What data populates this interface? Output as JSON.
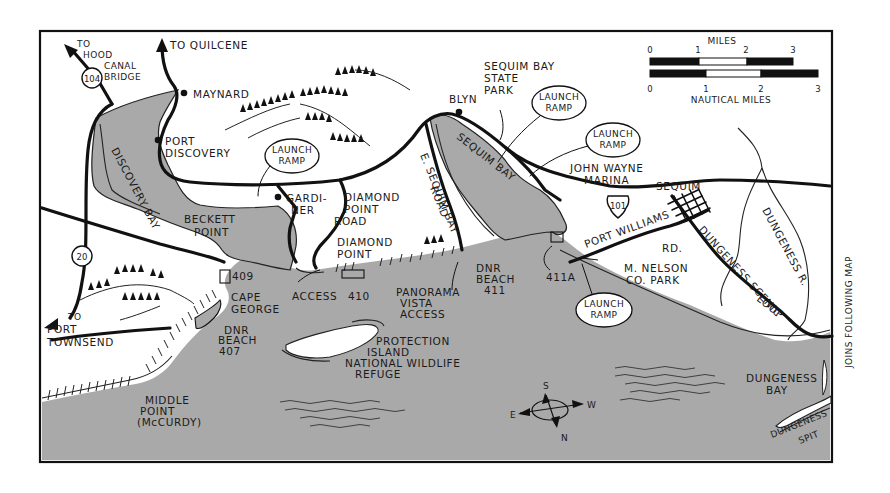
{
  "map": {
    "colors": {
      "water": "#a9a9a9",
      "land": "#ffffff",
      "ink": "#111111"
    },
    "side_note": "JOINS FOLLOWING MAP",
    "routes": {
      "hood_canal": {
        "to": "TO",
        "line1": "HOOD",
        "line2": "CANAL",
        "line3": "BRIDGE",
        "shield": "104"
      },
      "quilcene": {
        "label": "TO QUILCENE"
      },
      "port_townsend": {
        "to": "TO",
        "line1": "PORT",
        "line2": "TOWNSEND",
        "shield": "20"
      },
      "us101": {
        "shield": "101"
      }
    },
    "places": {
      "maynard": "MAYNARD",
      "port_discovery": {
        "line1": "PORT",
        "line2": "DISCOVERY"
      },
      "discovery_bay": "DISCOVERY BAY",
      "beckett_point": {
        "line1": "BECKETT",
        "line2": "POINT"
      },
      "gardiner": {
        "line1": "GARDI-",
        "line2": "NER"
      },
      "diamond_point_road": {
        "line1": "DIAMOND",
        "line2": "POINT",
        "line3": "ROAD"
      },
      "diamond_point": {
        "line1": "DIAMOND",
        "line2": "POINT"
      },
      "blyn": "BLYN",
      "sequim_bay_state_park": {
        "line1": "SEQUIM BAY",
        "line2": "STATE",
        "line3": "PARK"
      },
      "e_sequim_bay_road": {
        "line1": "E. SEQUIM BAY",
        "line2": "ROAD"
      },
      "sequim_bay": "SEQUIM BAY",
      "john_wayne_marina": {
        "line1": "JOHN WAYNE",
        "line2": "MARINA"
      },
      "sequim": "SEQUIM",
      "port_williams_rd": {
        "line1": "PORT WILLIAMS",
        "line2": "RD."
      },
      "m_nelson_park": {
        "line1": "M. NELSON",
        "line2": "CO. PARK"
      },
      "dungeness_scenic_loop": {
        "line1": "DUNGENESS SCENIC",
        "line2": "LOOP"
      },
      "dungeness_r": "DUNGENESS R.",
      "dungeness_bay": {
        "line1": "DUNGENESS",
        "line2": "BAY"
      },
      "dungeness_spit": {
        "line1": "DUNGENESS",
        "line2": "SPIT"
      },
      "cape_george": {
        "line1": "CAPE",
        "line2": "GEORGE"
      },
      "middle_point": {
        "line1": "MIDDLE",
        "line2": "POINT",
        "line3": "(McCURDY)"
      },
      "protection_island": {
        "line1": "PROTECTION",
        "line2": "ISLAND",
        "line3": "NATIONAL WILDLIFE",
        "line4": "REFUGE"
      },
      "panorama_vista": {
        "line1": "PANORAMA",
        "line2": "VISTA",
        "line3": "ACCESS"
      },
      "access": "ACCESS"
    },
    "beaches": {
      "b409": "409",
      "b410": "410",
      "dnr407": {
        "line1": "DNR",
        "line2": "BEACH",
        "line3": "407"
      },
      "dnr411": {
        "line1": "DNR",
        "line2": "BEACH",
        "line3": "411"
      },
      "b411a": "411A"
    },
    "launch_ramps": [
      {
        "line1": "LAUNCH",
        "line2": "RAMP"
      },
      {
        "line1": "LAUNCH",
        "line2": "RAMP"
      },
      {
        "line1": "LAUNCH",
        "line2": "RAMP"
      },
      {
        "line1": "LAUNCH",
        "line2": "RAMP"
      }
    ],
    "scale": {
      "miles_label": "MILES",
      "nautical_label": "NAUTICAL MILES",
      "miles_ticks": [
        "0",
        "1",
        "2",
        "3"
      ],
      "nautical_ticks": [
        "0",
        "1",
        "2",
        "3"
      ]
    },
    "compass": {
      "s": "S",
      "w": "W",
      "e": "E",
      "n": "N"
    }
  }
}
